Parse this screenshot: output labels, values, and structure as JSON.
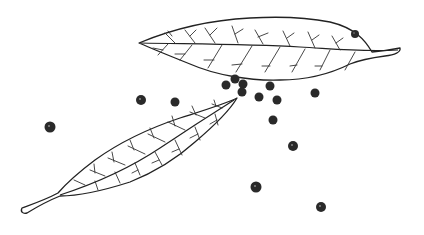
{
  "illustration": {
    "subject": "Bay leaves and black peppercorns line drawing",
    "style": "black ink line art on white",
    "background_color": "#ffffff",
    "ink_color": "#222222",
    "leaves": [
      {
        "name": "upper-leaf",
        "tip_left": [
          138,
          43
        ],
        "tip_right": [
          400,
          50
        ],
        "orientation": "horizontal"
      },
      {
        "name": "lower-leaf",
        "tip_upper_right": [
          237,
          98
        ],
        "stem_lower_left": [
          22,
          212
        ],
        "orientation": "diagonal"
      }
    ],
    "peppercorns": [
      {
        "x": 226,
        "y": 85,
        "r": 4.5
      },
      {
        "x": 235,
        "y": 79,
        "r": 4.5
      },
      {
        "x": 243,
        "y": 84,
        "r": 4.5
      },
      {
        "x": 242,
        "y": 92,
        "r": 4.5
      },
      {
        "x": 259,
        "y": 97,
        "r": 4.5
      },
      {
        "x": 270,
        "y": 86,
        "r": 4.5
      },
      {
        "x": 277,
        "y": 100,
        "r": 4.5
      },
      {
        "x": 273,
        "y": 120,
        "r": 4.5
      },
      {
        "x": 315,
        "y": 93,
        "r": 4.5
      },
      {
        "x": 355,
        "y": 34,
        "r": 4
      },
      {
        "x": 141,
        "y": 100,
        "r": 5
      },
      {
        "x": 175,
        "y": 102,
        "r": 4.5
      },
      {
        "x": 50,
        "y": 127,
        "r": 5.5
      },
      {
        "x": 293,
        "y": 146,
        "r": 5
      },
      {
        "x": 256,
        "y": 187,
        "r": 5.5
      },
      {
        "x": 321,
        "y": 207,
        "r": 5
      }
    ]
  }
}
